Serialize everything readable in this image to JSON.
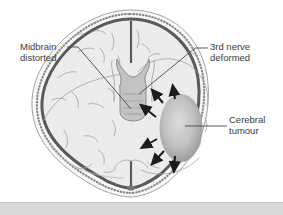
{
  "diagram": {
    "labels": {
      "midbrain": "Midbrain distorted",
      "third_nerve": "3rd nerve deformed",
      "cerebral_tumour": "Cerebral tumour"
    },
    "icons": {
      "expansion_arrows": "tumour-expansion-arrows"
    },
    "colors": {
      "background": "#ffffff",
      "skull_outline": "#8c8c8c",
      "stipple": "#8a8a8a",
      "dura_band": "#5a5a5a",
      "brain_fill": "#ececec",
      "sulci": "#a3a3a3",
      "midbrain_fill": "#c3c3c3",
      "midbrain_outline": "#818181",
      "tumour_center": "#dcdcdc",
      "tumour_mid": "#c2c2c2",
      "tumour_edge": "#989898",
      "arrow": "#1c1c1c",
      "leader_line": "#4a4a4a",
      "label_text": "#3c3c3c",
      "bottom_bar": "#d9d9d9",
      "bottom_bar_edge": "#c2c2c2"
    }
  }
}
